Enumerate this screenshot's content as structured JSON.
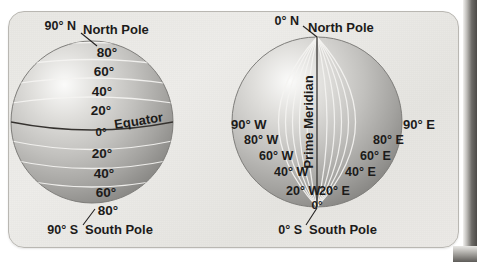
{
  "figure": {
    "panel_color": "#eceae7",
    "globe_shade_light": "#f3f2f0",
    "globe_shade_mid": "#c8c7c4",
    "globe_shade_dark": "#8f8e8b",
    "grid_line_color": "#f4f3f1",
    "label_color": "#1c1b1a"
  },
  "latitude_globe": {
    "name": "latitude-globe",
    "north_pole_tick": "90° N",
    "north_pole_label": "North Pole",
    "south_pole_tick": "90° S",
    "south_pole_label": "South Pole",
    "equator_label": "Equator",
    "equator_tick": "0°",
    "north_ticks": [
      "80°",
      "60°",
      "40°",
      "20°"
    ],
    "south_ticks": [
      "20°",
      "40°",
      "60°",
      "80°"
    ]
  },
  "longitude_globe": {
    "name": "longitude-globe",
    "north_pole_tick": "0° N",
    "north_pole_label": "North Pole",
    "south_pole_tick": "0° S",
    "south_pole_label": "South Pole",
    "prime_meridian_label": "Prime Meridian",
    "zero_tick": "0°",
    "west_ticks": [
      "90° W",
      "80° W",
      "60° W",
      "40° W",
      "20° W"
    ],
    "east_ticks": [
      "90° E",
      "80° E",
      "60° E",
      "40° E",
      "20° E"
    ]
  }
}
